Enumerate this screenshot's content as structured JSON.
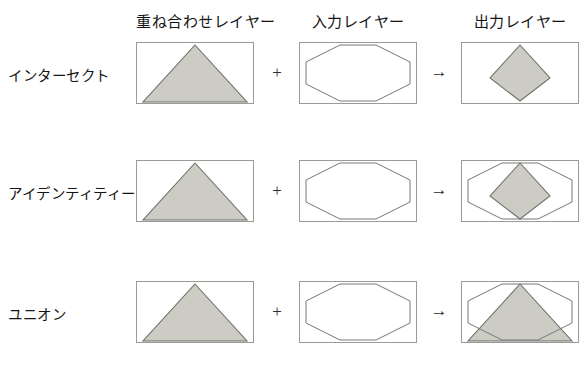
{
  "figure": {
    "caption": "",
    "column_headers": [
      {
        "id": "overlay-layer",
        "label": "重ね合わせレイヤー",
        "x": 136,
        "width": 118
      },
      {
        "id": "input-layer",
        "label": "入力レイヤー",
        "x": 299,
        "width": 118
      },
      {
        "id": "output-layer",
        "label": "出力レイヤー",
        "x": 461,
        "width": 118
      }
    ],
    "header_y": 10,
    "rows": [
      {
        "id": "intersect",
        "label": "インターセクト",
        "label_x": 8,
        "label_y": 64,
        "box_y": 42
      },
      {
        "id": "identity",
        "label": "アイデンティティー",
        "label_x": 8,
        "label_y": 182,
        "box_y": 160
      },
      {
        "id": "union",
        "label": "ユニオン",
        "label_x": 8,
        "label_y": 303,
        "box_y": 281
      }
    ],
    "operators": {
      "plus": "+",
      "arrow": "→",
      "plus_x": 262,
      "arrow_x": 424
    },
    "box": {
      "width": 118,
      "height": 62,
      "columns_x": [
        136,
        299,
        461
      ]
    },
    "colors": {
      "fill": "#cdccc4",
      "shape_stroke": "#6e6f68",
      "octagon_stroke": "#77787a",
      "box_border": "#9a9a96",
      "text": "#161616",
      "background": "#ffffff"
    },
    "shapes": {
      "triangle_points": "59,3 111,60 7,60",
      "octagon_points": "41,3 77,3 111,20 111,42 77,59 41,59 7,42 7,20",
      "intersect_points": "59,3 89,36 59,59 29,36",
      "identity_fill_points": "59,3 89,36 59,59 29,36",
      "union_fill_points": "59,3 111,60 7,60"
    }
  }
}
